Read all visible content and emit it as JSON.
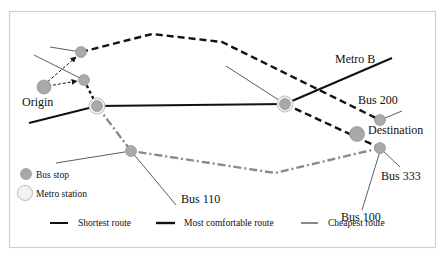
{
  "diagram": {
    "type": "route-map",
    "labels": {
      "origin": "Origin",
      "destination": "Destination",
      "metro_b": "Metro B",
      "bus_200": "Bus 200",
      "bus_333": "Bus 333",
      "bus_100": "Bus 100",
      "bus_110": "Bus 110"
    },
    "legend_nodes": [
      {
        "label": "Bus stop",
        "symbol": "gray-filled-circle"
      },
      {
        "label": "Metro station",
        "symbol": "light-double-circle"
      }
    ],
    "legend_routes": [
      {
        "label": "Shortest route",
        "style": "solid",
        "color": "#111111"
      },
      {
        "label": "Most comfortable route",
        "style": "dashed",
        "color": "#111111"
      },
      {
        "label": "Cheapest route",
        "style": "dash-dot",
        "color": "#8a8a8a"
      }
    ],
    "colors": {
      "bus_stop_fill": "#a9a9a9",
      "metro_ring": "#c8c8c8",
      "route_dark": "#111111",
      "route_gray": "#8a8a8a",
      "frame": "#cfcfcf"
    }
  }
}
